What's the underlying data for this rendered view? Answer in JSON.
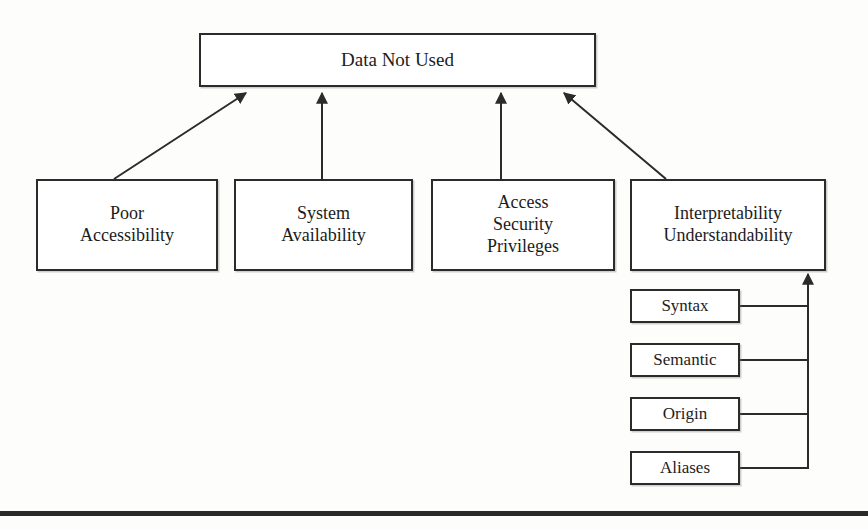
{
  "diagram": {
    "title": "Data Not Used",
    "type": "cause-hierarchy-diagram",
    "root": {
      "id": "root",
      "label": "Data Not Used"
    },
    "causes": [
      {
        "id": "poor-accessibility",
        "label": "Poor\nAccessibility"
      },
      {
        "id": "system-availability",
        "label": "System\nAvailability"
      },
      {
        "id": "access-security-privileges",
        "label": "Access\nSecurity\nPrivileges"
      },
      {
        "id": "interpretability-understandability",
        "label": "Interpretability\nUnderstandability"
      }
    ],
    "sub_causes": [
      {
        "id": "syntax",
        "label": "Syntax",
        "parent": "interpretability-understandability"
      },
      {
        "id": "semantic",
        "label": "Semantic",
        "parent": "interpretability-understandability"
      },
      {
        "id": "origin",
        "label": "Origin",
        "parent": "interpretability-understandability"
      },
      {
        "id": "aliases",
        "label": "Aliases",
        "parent": "interpretability-understandability"
      }
    ],
    "colors": {
      "stroke": "#2b2b2b",
      "fill": "#ffffff",
      "text": "#1c1c1c",
      "rule": "#2a2a2a"
    }
  }
}
